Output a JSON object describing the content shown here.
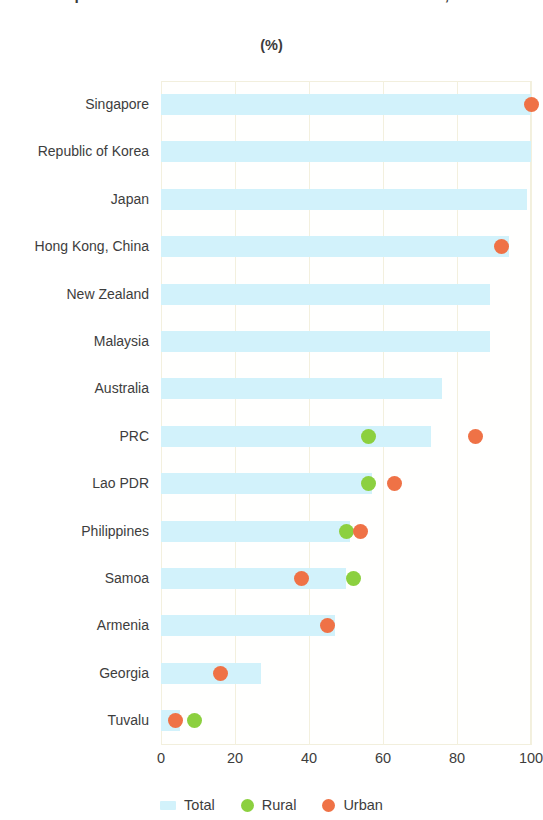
{
  "chart_data": {
    "type": "bar",
    "title": "Population with Access to Basic Sanitation Services, 2021",
    "subtitle": "(%)",
    "xlabel": "",
    "ylabel": "",
    "xlim": [
      0,
      100
    ],
    "xticks": [
      0,
      20,
      40,
      60,
      80,
      100
    ],
    "xtick_labels": [
      "0",
      "20",
      "40",
      "60",
      "80",
      "100"
    ],
    "grid": true,
    "orientation": "horizontal",
    "legend_position": "bottom",
    "categories": [
      "Singapore",
      "Republic of Korea",
      "Japan",
      "Hong Kong, China",
      "New Zealand",
      "Malaysia",
      "Australia",
      "PRC",
      "Lao PDR",
      "Philippines",
      "Samoa",
      "Armenia",
      "Georgia",
      "Tuvalu"
    ],
    "series": [
      {
        "name": "Total",
        "type": "bar",
        "color": "#d2f2fb",
        "values": [
          100,
          100,
          99,
          94,
          89,
          89,
          76,
          73,
          57,
          51,
          50,
          47,
          27,
          5
        ]
      },
      {
        "name": "Rural",
        "type": "scatter",
        "color": "#8cd03f",
        "values": [
          null,
          null,
          null,
          null,
          null,
          null,
          null,
          56,
          56,
          50,
          52,
          null,
          null,
          9
        ]
      },
      {
        "name": "Urban",
        "type": "scatter",
        "color": "#ef7246",
        "values": [
          100,
          null,
          null,
          92,
          null,
          null,
          null,
          85,
          63,
          54,
          38,
          45,
          16,
          4
        ]
      }
    ]
  },
  "legend": {
    "items": [
      {
        "label": "Total",
        "color": "#d2f2fb",
        "marker": "bar"
      },
      {
        "label": "Rural",
        "color": "#8cd03f",
        "marker": "dot"
      },
      {
        "label": "Urban",
        "color": "#ef7246",
        "marker": "dot"
      }
    ]
  },
  "colors": {
    "total": "#d2f2fb",
    "rural": "#8cd03f",
    "urban": "#ef7246",
    "grid": "#f3f0de",
    "text": "#3d3d3d"
  }
}
